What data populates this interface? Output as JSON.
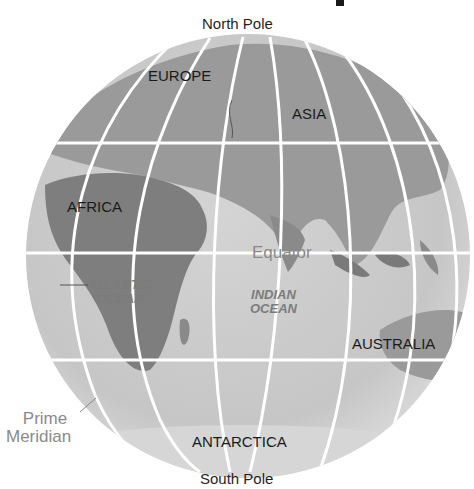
{
  "diagram": {
    "type": "globe-eastern-hemisphere",
    "poles": {
      "north": "North Pole",
      "south": "South Pole"
    },
    "continents": [
      {
        "id": "europe",
        "label": "EUROPE"
      },
      {
        "id": "asia",
        "label": "ASIA"
      },
      {
        "id": "africa",
        "label": "AFRICA"
      },
      {
        "id": "australia",
        "label": "AUSTRALIA"
      },
      {
        "id": "antarctica",
        "label": "ANTARCTICA"
      }
    ],
    "oceans": [
      {
        "id": "atlantic",
        "line1": "ATLANTIC",
        "line2": "OCEAN"
      },
      {
        "id": "indian",
        "line1": "INDIAN",
        "line2": "OCEAN"
      }
    ],
    "lines": {
      "equator": "Equator",
      "prime_meridian_line1": "Prime",
      "prime_meridian_line2": "Meridian"
    },
    "colors": {
      "globe_fill": "#c8c8c8",
      "land": "#8e8e8e",
      "grid": "#ffffff",
      "label_dark": "#1a1a1a",
      "label_grey": "#8a8a8a"
    }
  }
}
